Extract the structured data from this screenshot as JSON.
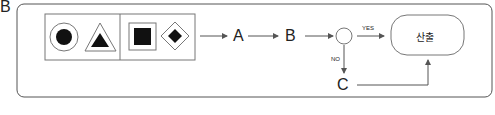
{
  "figure_label": "B",
  "nodes": {
    "a": "A",
    "b": "B",
    "c": "C",
    "output": "산출"
  },
  "edges": {
    "yes": "YES",
    "no": "NO"
  },
  "shapes": [
    "circle-in-circle",
    "triangle-in-triangle",
    "square-in-square",
    "diamond-in-diamond"
  ]
}
